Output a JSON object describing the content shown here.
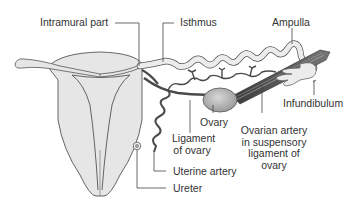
{
  "diagram": {
    "colors": {
      "organ_fill": "#e6e6e6",
      "organ_stroke": "#555555",
      "artery": "#4a4a4a",
      "label_text": "#333333",
      "leader_line": "#444444",
      "background": "#ffffff"
    },
    "labels": {
      "intramural_part": "Intramural part",
      "isthmus": "Isthmus",
      "ampulla": "Ampulla",
      "infundibulum": "Infundibulum",
      "ovary": "Ovary",
      "ligament_of_ovary_1": "Ligament",
      "ligament_of_ovary_2": "of ovary",
      "ovarian_artery_1": "Ovarian artery",
      "ovarian_artery_2": "in suspensory",
      "ovarian_artery_3": "ligament of",
      "ovarian_artery_4": "ovary",
      "uterine_artery": "Uterine artery",
      "ureter": "Ureter"
    }
  }
}
